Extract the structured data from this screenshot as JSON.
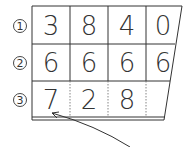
{
  "diagram": {
    "rows": [
      {
        "label": "①",
        "digits": [
          "3",
          "8",
          "4",
          "0"
        ]
      },
      {
        "label": "②",
        "digits": [
          "6",
          "6",
          "6",
          "6"
        ]
      },
      {
        "label": "③",
        "digits": [
          "7",
          "2",
          "8",
          ""
        ]
      }
    ],
    "arrow": {
      "from": "bottom-right",
      "to": "row-3-digit-1"
    },
    "colors": {
      "line": "#333333",
      "text": "#333333",
      "background": "#ffffff"
    }
  }
}
